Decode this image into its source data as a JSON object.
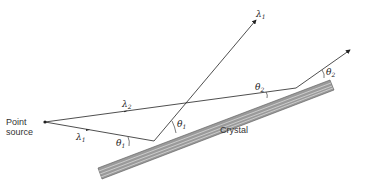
{
  "diagram": {
    "labels": {
      "point_source_line1": "Point",
      "point_source_line2": "source",
      "crystal": "Crystal",
      "lambda1_incident": "λ",
      "lambda1_incident_sub": "1",
      "lambda2_incident": "λ",
      "lambda2_incident_sub": "2",
      "lambda1_reflected": "λ",
      "lambda1_reflected_sub": "1",
      "theta1_incident": "θ",
      "theta1_incident_sub": "1",
      "theta1_reflected": "θ",
      "theta1_reflected_sub": "1",
      "theta2_incident": "θ",
      "theta2_incident_sub": "2",
      "theta2_reflected": "θ",
      "theta2_reflected_sub": "2"
    },
    "colors": {
      "line": "#222222",
      "crystal_fill": "#9a9a9a",
      "crystal_stripe": "#d8d8d8",
      "background": "#ffffff"
    }
  }
}
